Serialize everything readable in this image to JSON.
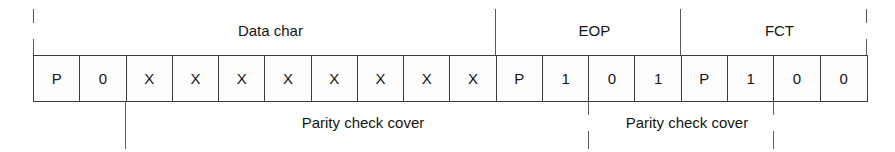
{
  "diagram": {
    "cell_count": 18,
    "cells": [
      {
        "label": "P"
      },
      {
        "label": "0"
      },
      {
        "label": "X"
      },
      {
        "label": "X"
      },
      {
        "label": "X"
      },
      {
        "label": "X"
      },
      {
        "label": "X"
      },
      {
        "label": "X"
      },
      {
        "label": "X"
      },
      {
        "label": "X"
      },
      {
        "label": "P"
      },
      {
        "label": "1"
      },
      {
        "label": "0"
      },
      {
        "label": "1"
      },
      {
        "label": "P"
      },
      {
        "label": "1"
      },
      {
        "label": "0"
      },
      {
        "label": "0"
      }
    ],
    "top_spans": [
      {
        "label": "Data char",
        "start_cell": 0,
        "end_cell": 10
      },
      {
        "label": "EOP",
        "start_cell": 10,
        "end_cell": 14
      },
      {
        "label": "FCT",
        "start_cell": 14,
        "end_cell": 18
      }
    ],
    "bottom_spans": [
      {
        "label": "Parity check cover",
        "start_cell": 2,
        "end_cell": 12
      },
      {
        "label": "Parity check cover",
        "start_cell": 12,
        "end_cell": 16
      }
    ],
    "colors": {
      "line": "#4a4a4a",
      "border": "#3c3c3c",
      "text": "#141414",
      "background": "#ffffff"
    }
  }
}
